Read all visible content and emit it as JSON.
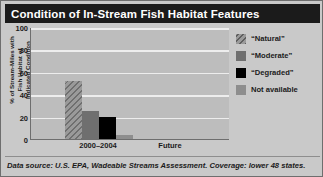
{
  "title": "Condition of In-Stream Fish Habitat Features",
  "y_axis_title_lines": [
    "% of Stream-Miles with",
    "Fish Habitat of",
    "Indicated Condition"
  ],
  "footer": "Data source: U.S. EPA, Wadeable Streams Assessment. Coverage: lower 48 states.",
  "legend": {
    "items": [
      {
        "label": "“Natural”",
        "swatch": "hatched-gray",
        "color": "#9a9a9a"
      },
      {
        "label": "“Moderate”",
        "swatch": "solid",
        "color": "#6f6f6f"
      },
      {
        "label": "“Degraded”",
        "swatch": "solid",
        "color": "#000000"
      },
      {
        "label": "Not available",
        "swatch": "solid",
        "color": "#8e8e8e"
      }
    ]
  },
  "chart_data": {
    "type": "bar",
    "title": "Condition of In-Stream Fish Habitat Features",
    "xlabel": "",
    "ylabel": "% of Stream-Miles with Fish Habitat of Indicated Condition",
    "categories": [
      "2000–2004",
      "Future"
    ],
    "series": [
      {
        "name": "“Natural”",
        "values": [
          52,
          null
        ]
      },
      {
        "name": "“Moderate”",
        "values": [
          25,
          null
        ]
      },
      {
        "name": "“Degraded”",
        "values": [
          20,
          null
        ]
      },
      {
        "name": "Not available",
        "values": [
          4,
          null
        ]
      }
    ],
    "ylim": [
      0,
      100
    ],
    "yticks": [
      100,
      80,
      60,
      40,
      20,
      0
    ],
    "ytick_labels": [
      "100",
      "80",
      "60",
      "40",
      "20",
      "0"
    ],
    "grid": true,
    "legend_position": "right"
  }
}
